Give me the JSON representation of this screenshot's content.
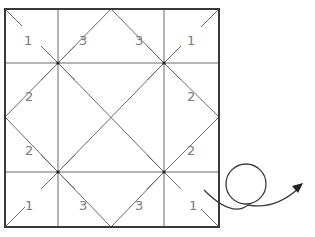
{
  "diagram": {
    "type": "origami folding diagram",
    "colors": {
      "border": "#3a3a3a",
      "lines": "#6a6a6a",
      "labels": "#7a7a7a"
    },
    "labels": {
      "top_left": "1",
      "top_inner_left": "3",
      "top_inner_right": "3",
      "top_right": "1",
      "left_upper": "2",
      "right_upper": "2",
      "left_lower": "2",
      "right_lower": "2",
      "bottom_left": "1",
      "bottom_inner_left": "3",
      "bottom_inner_right": "3",
      "bottom_right": "1"
    },
    "symbol": "turn-over-arrow"
  }
}
